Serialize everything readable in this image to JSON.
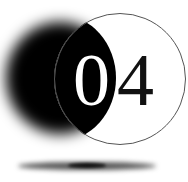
{
  "graphic": {
    "number_label": "04",
    "digits": [
      "0",
      "4"
    ],
    "colors": {
      "background": "#ffffff",
      "dark_circle": "#000000",
      "ring_outline": "#555555",
      "digit_on_dark": "#ffffff",
      "digit_on_light": "#111111",
      "shadow": "#555555"
    }
  }
}
